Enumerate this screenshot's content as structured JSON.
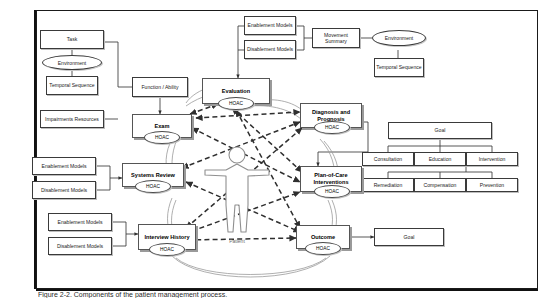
{
  "figure": {
    "caption": "Figure 2-2. Components of the patient management process.",
    "patient_label": "Patient",
    "hoac_label": "HOAC"
  },
  "main_elements": [
    {
      "id": "evaluation",
      "label": "Evaluation"
    },
    {
      "id": "diagnosis",
      "label": "Diagnosis and Prognosis"
    },
    {
      "id": "plan",
      "label": "Plan-of-Care Interventions"
    },
    {
      "id": "outcome",
      "label": "Outcome"
    },
    {
      "id": "interview",
      "label": "Interview History"
    },
    {
      "id": "systems",
      "label": "Systems Review"
    },
    {
      "id": "exam",
      "label": "Exam"
    }
  ],
  "left_cluster": {
    "task": "Task",
    "environment": "Environment",
    "temporal_sequence": "Temporal Sequence",
    "impairments_resources": "Impairments Resources",
    "function_ability": "Function / Ability"
  },
  "top_cluster": {
    "enablement_models": "Enablement Models",
    "disablement_models": "Disablement Models",
    "movement_summary": "Movement Summary",
    "environment": "Environment",
    "temporal_sequence": "Temporal Sequence"
  },
  "systems_review_inputs": {
    "enablement_models": "Enablement Models",
    "disablement_models": "Disablement Models"
  },
  "interview_inputs": {
    "enablement_models": "Enablement Models",
    "disablement_models": "Disablement Models"
  },
  "goal_tree": {
    "root": "Goal",
    "level1": [
      "Consultation",
      "Education",
      "Intervention"
    ],
    "level2": [
      "Remediation",
      "Compensation",
      "Prevention"
    ]
  },
  "outcome_goal": "Goal",
  "colors": {
    "line": "#3a3a3a",
    "thick_border": "#555555",
    "shadow": "#9a9a9a",
    "frame": "#111111",
    "patient_stroke": "#8a8a8a",
    "dashed": "#2f2f2f"
  }
}
